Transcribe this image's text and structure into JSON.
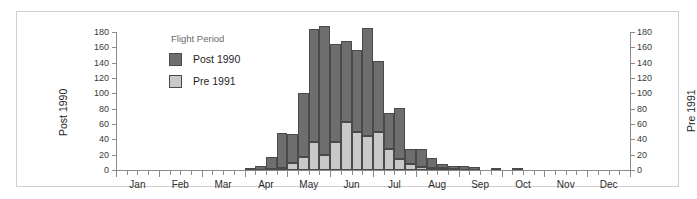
{
  "figure": {
    "legend_title": "Flight Period",
    "left_axis_title": "Post 1990",
    "right_axis_title": "Pre 1991"
  },
  "legend": {
    "items": [
      {
        "label": "Post 1990",
        "color": "#6e6e6e",
        "key": "post"
      },
      {
        "label": "Pre 1991",
        "color": "#c9c9c9",
        "key": "pre"
      }
    ]
  },
  "chart_data": {
    "type": "bar",
    "title": "",
    "subtitle": "",
    "xlabel": "",
    "ylabel": "Post 1990",
    "y2label": "Pre 1991",
    "ylim": [
      0,
      180
    ],
    "y2lim": [
      0,
      180
    ],
    "yticks": [
      0,
      20,
      40,
      60,
      80,
      100,
      120,
      140,
      160,
      180
    ],
    "y2ticks": [
      0,
      20,
      40,
      60,
      80,
      100,
      120,
      140,
      160,
      180
    ],
    "grid": false,
    "stacked": true,
    "legend_position": "upper-left-inside",
    "categories": [
      "Jan",
      "Feb",
      "Mar",
      "Apr",
      "May",
      "Jun",
      "Jul",
      "Aug",
      "Sep",
      "Oct",
      "Nov",
      "Dec"
    ],
    "bar_interval": "quarter-month",
    "bins": [
      {
        "index": 0,
        "month": "Jan",
        "pre": 0,
        "post": 0
      },
      {
        "index": 1,
        "month": "Jan",
        "pre": 0,
        "post": 0
      },
      {
        "index": 2,
        "month": "Jan",
        "pre": 0,
        "post": 0
      },
      {
        "index": 3,
        "month": "Jan",
        "pre": 0,
        "post": 0
      },
      {
        "index": 4,
        "month": "Feb",
        "pre": 0,
        "post": 0
      },
      {
        "index": 5,
        "month": "Feb",
        "pre": 0,
        "post": 0
      },
      {
        "index": 6,
        "month": "Feb",
        "pre": 0,
        "post": 0
      },
      {
        "index": 7,
        "month": "Feb",
        "pre": 0,
        "post": 0
      },
      {
        "index": 8,
        "month": "Mar",
        "pre": 0,
        "post": 0
      },
      {
        "index": 9,
        "month": "Mar",
        "pre": 0,
        "post": 0
      },
      {
        "index": 10,
        "month": "Mar",
        "pre": 0,
        "post": 0
      },
      {
        "index": 11,
        "month": "Mar",
        "pre": 0,
        "post": 0
      },
      {
        "index": 12,
        "month": "Apr",
        "pre": 0,
        "post": 2
      },
      {
        "index": 13,
        "month": "Apr",
        "pre": 0,
        "post": 5
      },
      {
        "index": 14,
        "month": "Apr",
        "pre": 1,
        "post": 16
      },
      {
        "index": 15,
        "month": "Apr",
        "pre": 2,
        "post": 46
      },
      {
        "index": 16,
        "month": "May",
        "pre": 9,
        "post": 38
      },
      {
        "index": 17,
        "month": "May",
        "pre": 17,
        "post": 83
      },
      {
        "index": 18,
        "month": "May",
        "pre": 36,
        "post": 148
      },
      {
        "index": 19,
        "month": "May",
        "pre": 20,
        "post": 168
      },
      {
        "index": 20,
        "month": "Jun",
        "pre": 37,
        "post": 127
      },
      {
        "index": 21,
        "month": "Jun",
        "pre": 62,
        "post": 106
      },
      {
        "index": 22,
        "month": "Jun",
        "pre": 50,
        "post": 106
      },
      {
        "index": 23,
        "month": "Jun",
        "pre": 45,
        "post": 140
      },
      {
        "index": 24,
        "month": "Jul",
        "pre": 50,
        "post": 92
      },
      {
        "index": 25,
        "month": "Jul",
        "pre": 27,
        "post": 48
      },
      {
        "index": 26,
        "month": "Jul",
        "pre": 15,
        "post": 66
      },
      {
        "index": 27,
        "month": "Jul",
        "pre": 8,
        "post": 20
      },
      {
        "index": 28,
        "month": "Aug",
        "pre": 4,
        "post": 23
      },
      {
        "index": 29,
        "month": "Aug",
        "pre": 3,
        "post": 13
      },
      {
        "index": 30,
        "month": "Aug",
        "pre": 2,
        "post": 6
      },
      {
        "index": 31,
        "month": "Aug",
        "pre": 1,
        "post": 4
      },
      {
        "index": 32,
        "month": "Sep",
        "pre": 0,
        "post": 5
      },
      {
        "index": 33,
        "month": "Sep",
        "pre": 0,
        "post": 4
      },
      {
        "index": 34,
        "month": "Sep",
        "pre": 0,
        "post": 0
      },
      {
        "index": 35,
        "month": "Sep",
        "pre": 0,
        "post": 1
      },
      {
        "index": 36,
        "month": "Oct",
        "pre": 0,
        "post": 0
      },
      {
        "index": 37,
        "month": "Oct",
        "pre": 0,
        "post": 2
      },
      {
        "index": 38,
        "month": "Oct",
        "pre": 0,
        "post": 0
      },
      {
        "index": 39,
        "month": "Oct",
        "pre": 0,
        "post": 0
      },
      {
        "index": 40,
        "month": "Nov",
        "pre": 0,
        "post": 0
      },
      {
        "index": 41,
        "month": "Nov",
        "pre": 0,
        "post": 0
      },
      {
        "index": 42,
        "month": "Nov",
        "pre": 0,
        "post": 0
      },
      {
        "index": 43,
        "month": "Nov",
        "pre": 0,
        "post": 0
      },
      {
        "index": 44,
        "month": "Dec",
        "pre": 0,
        "post": 0
      },
      {
        "index": 45,
        "month": "Dec",
        "pre": 0,
        "post": 0
      },
      {
        "index": 46,
        "month": "Dec",
        "pre": 0,
        "post": 0
      },
      {
        "index": 47,
        "month": "Dec",
        "pre": 0,
        "post": 0
      }
    ],
    "series": [
      {
        "name": "Pre 1991",
        "color": "#c9c9c9"
      },
      {
        "name": "Post 1990",
        "color": "#6e6e6e"
      }
    ]
  }
}
